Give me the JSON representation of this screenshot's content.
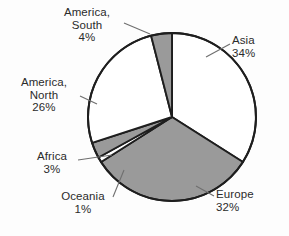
{
  "chart_data": {
    "type": "pie",
    "title": "",
    "subtitle": "",
    "xlabel": "",
    "ylabel": "",
    "legend_position": "none",
    "grid": false,
    "labels_show_percent": true,
    "start_angle_deg": 0,
    "direction": "clockwise",
    "categories": [
      "Asia",
      "Europe",
      "Oceania",
      "Africa",
      "America, North",
      "America, South"
    ],
    "values": [
      34,
      32,
      1,
      3,
      26,
      4
    ],
    "units": "%",
    "slices": [
      {
        "name": "Asia",
        "label": "Asia",
        "value": 34,
        "value_text": "34%",
        "fill": "#ffffff",
        "stroke": "#1e1e1e"
      },
      {
        "name": "Europe",
        "label": "Europe",
        "value": 32,
        "value_text": "32%",
        "fill": "#9a9a9a",
        "stroke": "#1e1e1e"
      },
      {
        "name": "Oceania",
        "label": "Oceania",
        "value": 1,
        "value_text": "1%",
        "fill": "#ffffff",
        "stroke": "#1e1e1e"
      },
      {
        "name": "Africa",
        "label": "Africa",
        "value": 3,
        "value_text": "3%",
        "fill": "#9a9a9a",
        "stroke": "#1e1e1e"
      },
      {
        "name": "America, North",
        "label": "America,\nNorth",
        "value": 26,
        "value_text": "26%",
        "fill": "#ffffff",
        "stroke": "#1e1e1e"
      },
      {
        "name": "America, South",
        "label": "America,\nSouth",
        "value": 4,
        "value_text": "4%",
        "fill": "#9a9a9a",
        "stroke": "#1e1e1e"
      }
    ]
  },
  "labels": {
    "america_south": {
      "line1": "America,",
      "line2": "South",
      "percent": "4%"
    },
    "asia": {
      "line1": "Asia",
      "percent": "34%"
    },
    "america_north": {
      "line1": "America,",
      "line2": "North",
      "percent": "26%"
    },
    "africa": {
      "line1": "Africa",
      "percent": "3%"
    },
    "oceania": {
      "line1": "Oceania",
      "percent": "1%"
    },
    "europe": {
      "line1": "Europe",
      "percent": "32%"
    }
  },
  "colors": {
    "background": "#fdfdfd",
    "slice_gray": "#9a9a9a",
    "slice_white": "#ffffff",
    "outline": "#1e1e1e",
    "leader_line": "#6f6f6f",
    "text": "#2b2b2b"
  }
}
